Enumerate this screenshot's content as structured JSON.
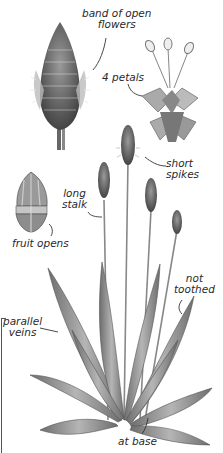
{
  "illustration": {
    "subject": "plantain plant",
    "labels": {
      "band_of_open_flowers": "band of open\nflowers",
      "band_line1": "band of open",
      "band_line2": "flowers",
      "four_petals": "4 petals",
      "short_spikes_line1": "short",
      "short_spikes_line2": "spikes",
      "long_stalk_line1": "long",
      "long_stalk_line2": "stalk",
      "fruit_opens": "fruit opens",
      "not_toothed_line1": "not",
      "not_toothed_line2": "toothed",
      "parallel_veins_line1": "parallel",
      "parallel_veins_line2": "veins",
      "at_base": "at base"
    },
    "colors": {
      "ink": "#2a2a2a",
      "leaf": "#8a8a8a",
      "leaf_dark": "#5a5a5a",
      "background": "#ffffff"
    }
  }
}
